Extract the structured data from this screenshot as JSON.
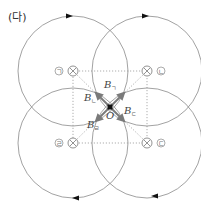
{
  "figure": {
    "panel_label": "(다)",
    "origin_label": "O",
    "wires": [
      {
        "id": "ㄱ",
        "tag": "ㄱ",
        "current": "into-page",
        "cx": 73,
        "cy": 71
      },
      {
        "id": "ㄴ",
        "tag": "ㄴ",
        "current": "into-page",
        "cx": 147,
        "cy": 71
      },
      {
        "id": "ㄹ",
        "tag": "ㄹ",
        "current": "into-page",
        "cx": 73,
        "cy": 143
      },
      {
        "id": "ㄷ",
        "tag": "ㄷ",
        "current": "into-page",
        "cx": 147,
        "cy": 143
      }
    ],
    "field_labels": [
      {
        "base": "B",
        "sub": "ㄱ"
      },
      {
        "base": "B",
        "sub": "ㄴ"
      },
      {
        "base": "B",
        "sub": "ㄹ"
      },
      {
        "base": "B",
        "sub": "ㄷ"
      }
    ],
    "colors": {
      "circle": "#8a8a8a",
      "dotted": "#8a8a8a",
      "arrow": "#808080",
      "origin": "#111111"
    }
  }
}
